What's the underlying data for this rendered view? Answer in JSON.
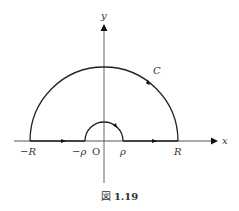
{
  "figure": {
    "caption_prefix": "図",
    "caption_number": "1.19",
    "labels": {
      "y_axis": "y",
      "x_axis": "x",
      "contour": "C",
      "neg_R": "−R",
      "neg_rho": "−ρ",
      "origin": "O",
      "rho": "ρ",
      "R": "R"
    },
    "colors": {
      "stroke": "#222222",
      "axis": "#555555"
    }
  }
}
